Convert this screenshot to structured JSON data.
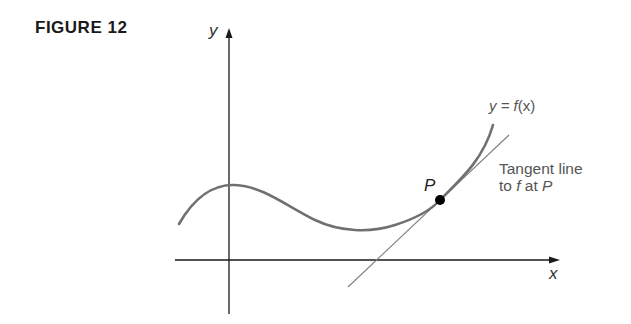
{
  "figure": {
    "label": "FIGURE 12",
    "axes": {
      "x_label": "x",
      "y_label": "y"
    },
    "curve_label": {
      "prefix": "y = ",
      "func": "f",
      "arg": "(x)"
    },
    "point_label": "P",
    "tangent_label": {
      "line1": "Tangent line",
      "line2_pre": "to ",
      "line2_f": "f",
      "line2_mid": " at ",
      "line2_p": "P"
    },
    "colors": {
      "curve": "#707070",
      "axes": "#1a1a1a",
      "tangent": "#808080",
      "point": "#000000",
      "text": "#555555"
    }
  }
}
